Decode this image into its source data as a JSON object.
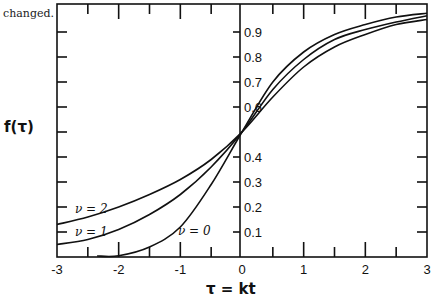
{
  "caption_fragment": "changed.",
  "chart_data": {
    "type": "line",
    "title": "",
    "xlabel": "τ = kt",
    "ylabel": "f(τ)",
    "xlim": [
      -3,
      3
    ],
    "ylim": [
      0,
      1
    ],
    "grid": false,
    "legend": "inline labels near curves",
    "x_ticks": [
      -3,
      -2,
      -1,
      0,
      1,
      2,
      3
    ],
    "x_tick_labels": [
      "-3",
      "-2",
      "-1",
      "0",
      "1",
      "2",
      "3"
    ],
    "y_ticks": [
      0.1,
      0.2,
      0.3,
      0.4,
      0.6,
      0.7,
      0.8,
      0.9
    ],
    "y_tick_labels": [
      "0.1",
      "0.2",
      "0.3",
      "0.4",
      "0.6",
      "0.7",
      "0.8",
      "0.9"
    ],
    "x": [
      -3,
      -2.5,
      -2,
      -1.5,
      -1,
      -0.5,
      0,
      0.5,
      1,
      1.5,
      2,
      2.5,
      3
    ],
    "series": [
      {
        "name": "ν = 2",
        "label": "ν = 2",
        "values": [
          0.13,
          0.16,
          0.2,
          0.25,
          0.31,
          0.39,
          0.5,
          0.64,
          0.76,
          0.84,
          0.89,
          0.93,
          0.95
        ]
      },
      {
        "name": "ν = 1",
        "label": "ν = 1",
        "values": [
          0.05,
          0.07,
          0.11,
          0.17,
          0.25,
          0.36,
          0.5,
          0.67,
          0.79,
          0.87,
          0.91,
          0.94,
          0.965
        ]
      },
      {
        "name": "ν = 0",
        "label": "ν = 0",
        "values": [
          0.0,
          0.0,
          0.005,
          0.04,
          0.12,
          0.29,
          0.5,
          0.7,
          0.82,
          0.89,
          0.93,
          0.96,
          0.975
        ]
      }
    ]
  }
}
